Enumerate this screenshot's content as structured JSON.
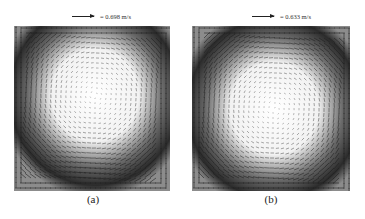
{
  "figure": {
    "panels": [
      {
        "id": "a",
        "caption": "(a)",
        "scale_label": "= 0.698 m/s",
        "scale_value_mps": 0.698,
        "ref_arrow_length_px": 22,
        "vortex_center": [
          0.52,
          0.42
        ],
        "rotation": "clockwise"
      },
      {
        "id": "b",
        "caption": "(b)",
        "scale_label": "= 0.633 m/s",
        "scale_value_mps": 0.633,
        "ref_arrow_length_px": 22,
        "vortex_center": [
          0.52,
          0.5
        ],
        "rotation": "clockwise"
      }
    ],
    "colors": {
      "arrow": "#1e1e1e",
      "background_dense": "#2b2b2b",
      "background_center": "#ffffff",
      "wall_region": "#8c8c8c"
    }
  }
}
